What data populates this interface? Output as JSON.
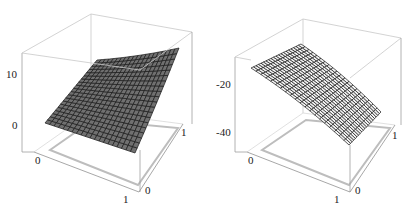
{
  "chart_data": [
    {
      "type": "surface3d",
      "title": "",
      "xlabel": "",
      "ylabel": "",
      "zlabel": "",
      "x_ticks": [
        "0",
        "1"
      ],
      "y_ticks": [
        "0",
        "1"
      ],
      "z_ticks": [
        "0",
        "10"
      ],
      "xlim": [
        0,
        1
      ],
      "ylim": [
        0,
        1
      ],
      "zlim": [
        -2,
        14
      ],
      "grid_cells": 20,
      "surface_color": "#707070",
      "mesh_color": "#1a1a1a",
      "description": "Rising, slightly convex surface from about 0 at x=0,y=0 up to about 12 at x=1,y=1",
      "corner_values": {
        "x0y0": 1,
        "x1y0": 0,
        "x0y1": 8,
        "x1y1": 12
      }
    },
    {
      "type": "surface3d",
      "title": "",
      "xlabel": "",
      "ylabel": "",
      "zlabel": "",
      "x_ticks": [
        "0",
        "1"
      ],
      "y_ticks": [
        "0",
        "1"
      ],
      "z_ticks": [
        "-20",
        "-40"
      ],
      "xlim": [
        0,
        1
      ],
      "ylim": [
        0,
        1
      ],
      "zlim": [
        -50,
        -5
      ],
      "grid_cells": 20,
      "surface_color": "#f2f2f2",
      "mesh_color": "#1a1a1a",
      "description": "Concave (dome-shaped) surface falling from about -15 at x=0 to about -45 at x=1",
      "corner_values": {
        "x0y0": -17,
        "x1y0": -45,
        "x0y1": -15,
        "x1y1": -38
      }
    }
  ]
}
